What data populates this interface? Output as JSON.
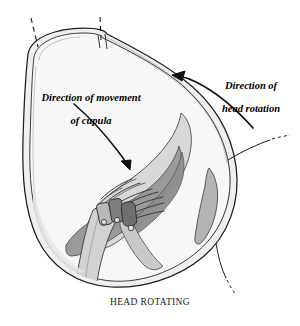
{
  "figure": {
    "caption": "HEAD ROTATING",
    "background_color": "#ffffff"
  },
  "annotations": {
    "cupula_movement": {
      "line1": "Direction of movement",
      "line2": "of cupula",
      "arrow_name": "cupula-movement-arrow"
    },
    "head_rotation": {
      "line1": "Direction of",
      "line2": "head rotation",
      "arrow_name": "head-rotation-arrow"
    }
  },
  "colors": {
    "outline": "#1c1c1c",
    "wall_fill": "#f0f0f0",
    "lumen_fill": "#f7f7f7",
    "vestibule_fill": "#efefef",
    "cupula_fill": "#d8d8d8",
    "crista_fill": "#9a9a9a",
    "duct_fill": "#d2d2d2",
    "hair_cell_fill": "#8f8f8f",
    "canal_crescent_fill": "#b4b4b4",
    "text_color": "#000000"
  },
  "structures": [
    {
      "name": "membranous-labyrinth-wall",
      "shade": "#f0f0f0"
    },
    {
      "name": "ampulla-lumen",
      "shade": "#f7f7f7"
    },
    {
      "name": "cupula",
      "shade": "#d8d8d8"
    },
    {
      "name": "crista-ampullaris",
      "shade": "#9a9a9a"
    },
    {
      "name": "hair-cell-bundle",
      "shade": "#8f8f8f"
    },
    {
      "name": "semicircular-duct-crescent",
      "shade": "#b4b4b4"
    },
    {
      "name": "utricle-duct",
      "shade": "#d2d2d2"
    },
    {
      "name": "cut-duct-dashed-left",
      "shade": "#1c1c1c"
    },
    {
      "name": "cut-duct-dashed-right",
      "shade": "#1c1c1c"
    }
  ]
}
